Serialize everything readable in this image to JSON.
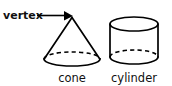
{
  "figure": {
    "background_color": "#ffffff",
    "stroke_color": "#000000",
    "text_color": "#111111",
    "width": 172,
    "height": 85
  },
  "annotation": {
    "label": "vertex",
    "pointer_icon": "arrow-right-icon",
    "points_to": "cone-apex"
  },
  "shapes": [
    {
      "key": "cone",
      "caption": "cone",
      "apex": {
        "x": 72,
        "y": 17
      },
      "base_center": {
        "x": 72,
        "y": 59
      },
      "base_rx": 28,
      "base_ry": 7,
      "hidden_edge": "dashed-back-arc",
      "visible_edge": "solid-front-arc"
    },
    {
      "key": "cylinder",
      "caption": "cylinder",
      "left": 110,
      "right": 158,
      "top_center": {
        "x": 134,
        "y": 24
      },
      "bottom_center": {
        "x": 134,
        "y": 57
      },
      "rx": 24,
      "ry": 7,
      "top_ellipse": "solid-full",
      "hidden_edge": "dashed-back-arc",
      "visible_edge": "solid-front-arc"
    }
  ]
}
